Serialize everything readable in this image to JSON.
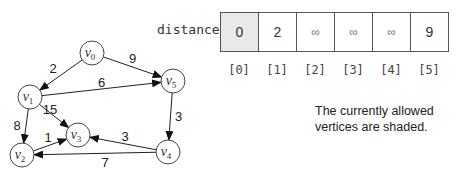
{
  "graph": {
    "nodes": [
      {
        "id": "v0",
        "base": "v",
        "sub": "0",
        "x": 92,
        "y": 53
      },
      {
        "id": "v1",
        "base": "v",
        "sub": "1",
        "x": 30,
        "y": 97
      },
      {
        "id": "v2",
        "base": "v",
        "sub": "2",
        "x": 22,
        "y": 155
      },
      {
        "id": "v3",
        "base": "v",
        "sub": "3",
        "x": 78,
        "y": 135
      },
      {
        "id": "v4",
        "base": "v",
        "sub": "4",
        "x": 168,
        "y": 152
      },
      {
        "id": "v5",
        "base": "v",
        "sub": "5",
        "x": 173,
        "y": 81
      }
    ],
    "edges": [
      {
        "from": "v0",
        "to": "v1",
        "weight": "2"
      },
      {
        "from": "v0",
        "to": "v5",
        "weight": "9"
      },
      {
        "from": "v1",
        "to": "v5",
        "weight": "6"
      },
      {
        "from": "v1",
        "to": "v3",
        "weight": "15"
      },
      {
        "from": "v1",
        "to": "v2",
        "weight": "8"
      },
      {
        "from": "v2",
        "to": "v3",
        "weight": "1"
      },
      {
        "from": "v4",
        "to": "v3",
        "weight": "3"
      },
      {
        "from": "v4",
        "to": "v2",
        "weight": "7"
      },
      {
        "from": "v5",
        "to": "v4",
        "weight": "3"
      }
    ]
  },
  "distance": {
    "label": "distance",
    "values": [
      "0",
      "2",
      "∞",
      "∞",
      "∞",
      "9"
    ],
    "shaded": [
      true,
      false,
      false,
      false,
      false,
      false
    ],
    "indices": [
      "[0]",
      "[1]",
      "[2]",
      "[3]",
      "[4]",
      "[5]"
    ]
  },
  "note": {
    "line1": "The currently allowed",
    "line2": "vertices are shaded."
  }
}
